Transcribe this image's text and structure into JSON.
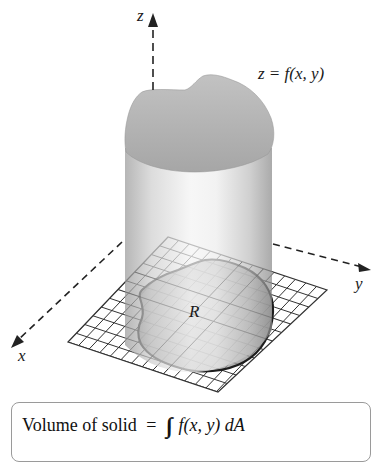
{
  "figure": {
    "type": "volume-under-surface-diagram",
    "axes": {
      "z_label": "z",
      "x_label": "x",
      "y_label": "y"
    },
    "surface_label": "z = f(x, y)",
    "region_label": "R",
    "formula": {
      "lhs": "Volume of solid",
      "equals": "=",
      "integral_symbol": "∬",
      "integrand": "f(x, y) dA",
      "region_subscript": "R"
    },
    "colors": {
      "surface": "#b9b9b9",
      "cylinder_dark": "#8c8c8c",
      "cylinder_light": "#f2f2f2",
      "region_fill": "#a8a8a8",
      "grid_lines": "#3a3a3a",
      "axis_lines": "#222222",
      "box_border": "#9a9a9a"
    }
  }
}
